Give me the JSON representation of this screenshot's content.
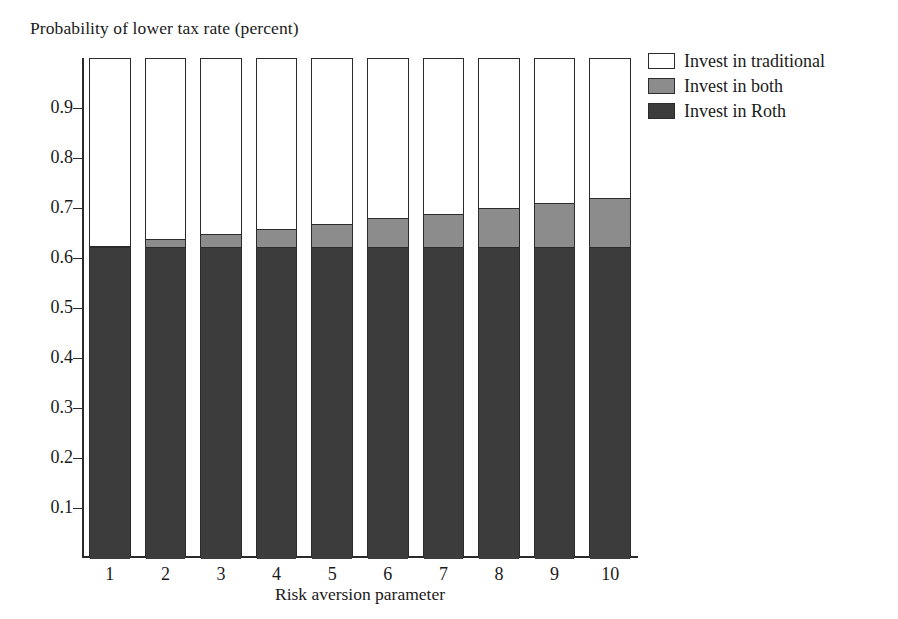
{
  "chart_data": {
    "type": "bar",
    "subtype": "stacked-bar",
    "title": "",
    "ylabel": "Probability of lower tax rate (percent)",
    "xlabel": "Risk aversion parameter",
    "categories": [
      "1",
      "2",
      "3",
      "4",
      "5",
      "6",
      "7",
      "8",
      "9",
      "10"
    ],
    "ylim": [
      0,
      1.0
    ],
    "ytick_labels": [
      "0.1",
      "0.2",
      "0.3",
      "0.4",
      "0.5",
      "0.6",
      "0.7",
      "0.8",
      "0.9"
    ],
    "ytick_values": [
      0.1,
      0.2,
      0.3,
      0.4,
      0.5,
      0.6,
      0.7,
      0.8,
      0.9
    ],
    "grid": false,
    "legend_position": "right-top",
    "stack_order_bottom_to_top": [
      "Invest in Roth",
      "Invest in both",
      "Invest in traditional"
    ],
    "series": [
      {
        "name": "Invest in Roth",
        "color": "#3c3c3c",
        "values": [
          0.622,
          0.622,
          0.622,
          0.622,
          0.622,
          0.622,
          0.622,
          0.622,
          0.622,
          0.622
        ]
      },
      {
        "name": "Invest in both",
        "color": "#8c8c8c",
        "values": [
          0.005,
          0.019,
          0.029,
          0.039,
          0.049,
          0.06,
          0.069,
          0.08,
          0.091,
          0.101
        ]
      },
      {
        "name": "Invest in traditional",
        "color": "#ffffff",
        "values": [
          0.373,
          0.359,
          0.349,
          0.339,
          0.329,
          0.318,
          0.309,
          0.298,
          0.287,
          0.277
        ]
      }
    ],
    "cumulative_tops": {
      "roth": [
        0.622,
        0.622,
        0.622,
        0.622,
        0.622,
        0.622,
        0.622,
        0.622,
        0.622,
        0.622
      ],
      "roth_plus_both": [
        0.627,
        0.641,
        0.651,
        0.661,
        0.671,
        0.682,
        0.691,
        0.702,
        0.713,
        0.723
      ],
      "total": [
        1.0,
        1.0,
        1.0,
        1.0,
        1.0,
        1.0,
        1.0,
        1.0,
        1.0,
        1.0
      ]
    }
  },
  "legend": {
    "items": [
      {
        "label": "Invest in traditional",
        "color": "#ffffff"
      },
      {
        "label": "Invest in both",
        "color": "#8c8c8c"
      },
      {
        "label": "Invest in Roth",
        "color": "#3c3c3c"
      }
    ]
  },
  "colors": {
    "axis": "#2b2b2b",
    "text": "#1a1a1a",
    "background": "#ffffff",
    "roth": "#3c3c3c",
    "both": "#8c8c8c",
    "traditional": "#ffffff"
  }
}
